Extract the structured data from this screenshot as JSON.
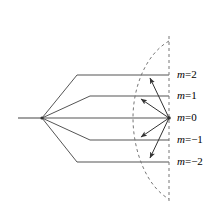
{
  "figure": {
    "type": "vector-model-splitting-diagram",
    "colors": {
      "line": "#555555",
      "dashed": "#777777",
      "text": "#000000",
      "background": "#ffffff",
      "arrow": "#333333"
    },
    "geometry": {
      "width": 218,
      "height": 212,
      "left_stub_x_start": 18,
      "left_vertex_x": 42,
      "left_vertex_y": 118,
      "right_vertex_x": 169,
      "right_vertex_y": 118,
      "dashed_axis_x": 169,
      "dashed_axis_y_top": 36,
      "dashed_axis_y_bottom": 202,
      "arc_leftmost_x": 133,
      "arc_top_y": 41,
      "arc_bottom_y": 199
    },
    "levels": [
      {
        "id": "level-m2",
        "label_m": "m",
        "label_rel": "=2",
        "label_full": "m=2",
        "m_value": 2,
        "y": 75,
        "line_start_x": 77,
        "line_end_x": 169,
        "tip_x": 146,
        "tip_y": 75
      },
      {
        "id": "level-m1",
        "label_m": "m",
        "label_rel": "=1",
        "label_full": "m=1",
        "m_value": 1,
        "y": 96,
        "line_start_x": 90,
        "line_end_x": 169,
        "tip_x": 137,
        "tip_y": 96
      },
      {
        "id": "level-m0",
        "label_m": "m",
        "label_rel": "=0",
        "label_full": "m=0",
        "m_value": 0,
        "y": 118,
        "line_start_x": 42,
        "line_end_x": 169,
        "tip_x": 169,
        "tip_y": 118
      },
      {
        "id": "level-m-1",
        "label_m": "m",
        "label_rel": "=−1",
        "label_full": "m=−1",
        "m_value": -1,
        "y": 140,
        "line_start_x": 90,
        "line_end_x": 169,
        "tip_x": 137,
        "tip_y": 140
      },
      {
        "id": "level-m-2",
        "label_m": "m",
        "label_rel": "=−2",
        "label_full": "m=−2",
        "m_value": -2,
        "y": 162,
        "line_start_x": 77,
        "line_end_x": 169,
        "tip_x": 146,
        "tip_y": 162
      }
    ],
    "label_x": 177
  }
}
